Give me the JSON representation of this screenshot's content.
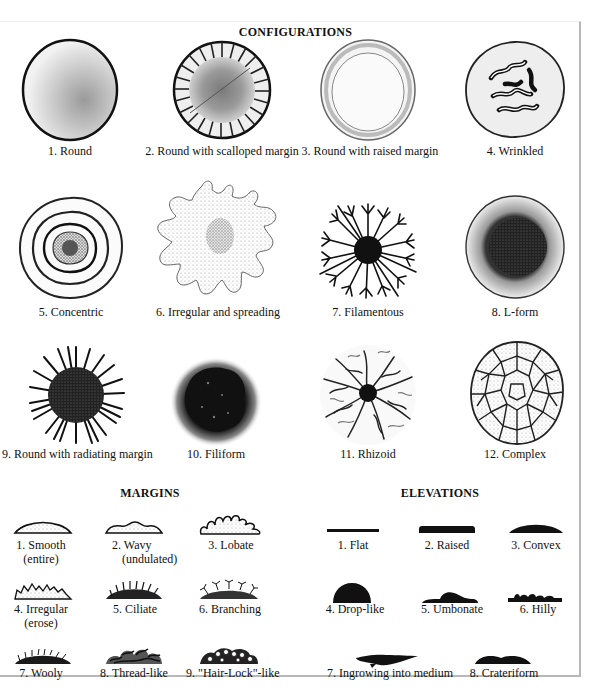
{
  "configurations": {
    "title": "CONFIGURATIONS",
    "items": [
      {
        "label": "1. Round",
        "icon": "round-colony-icon"
      },
      {
        "label": "2. Round with scalloped margin",
        "icon": "scalloped-colony-icon"
      },
      {
        "label": "3. Round with raised margin",
        "icon": "raised-margin-colony-icon"
      },
      {
        "label": "4. Wrinkled",
        "icon": "wrinkled-colony-icon"
      },
      {
        "label": "5. Concentric",
        "icon": "concentric-colony-icon"
      },
      {
        "label": "6. Irregular and spreading",
        "icon": "irregular-colony-icon"
      },
      {
        "label": "7. Filamentous",
        "icon": "filamentous-colony-icon"
      },
      {
        "label": "8. L-form",
        "icon": "l-form-colony-icon"
      },
      {
        "label": "9. Round with radiating margin",
        "icon": "radiating-colony-icon"
      },
      {
        "label": "10. Filiform",
        "icon": "filiform-colony-icon"
      },
      {
        "label": "11. Rhizoid",
        "icon": "rhizoid-colony-icon"
      },
      {
        "label": "12. Complex",
        "icon": "complex-colony-icon"
      }
    ]
  },
  "margins": {
    "title": "MARGINS",
    "items": [
      {
        "label": "1. Smooth",
        "sub": "(entire)",
        "icon": "smooth-margin-icon"
      },
      {
        "label": "2. Wavy",
        "sub": "(undulated)",
        "icon": "wavy-margin-icon"
      },
      {
        "label": "3. Lobate",
        "sub": "",
        "icon": "lobate-margin-icon"
      },
      {
        "label": "4. Irregular",
        "sub": "(erose)",
        "icon": "irregular-margin-icon"
      },
      {
        "label": "5. Ciliate",
        "sub": "",
        "icon": "ciliate-margin-icon"
      },
      {
        "label": "6. Branching",
        "sub": "",
        "icon": "branching-margin-icon"
      },
      {
        "label": "7. Wooly",
        "sub": "",
        "icon": "wooly-margin-icon"
      },
      {
        "label": "8. Thread-like",
        "sub": "",
        "icon": "thread-like-margin-icon"
      },
      {
        "label": "9. \"Hair-Lock\"-like",
        "sub": "",
        "icon": "hair-lock-margin-icon"
      }
    ]
  },
  "elevations": {
    "title": "ELEVATIONS",
    "items": [
      {
        "label": "1. Flat",
        "icon": "flat-elevation-icon"
      },
      {
        "label": "2. Raised",
        "icon": "raised-elevation-icon"
      },
      {
        "label": "3. Convex",
        "icon": "convex-elevation-icon"
      },
      {
        "label": "4. Drop-like",
        "icon": "drop-like-elevation-icon"
      },
      {
        "label": "5. Umbonate",
        "icon": "umbonate-elevation-icon"
      },
      {
        "label": "6. Hilly",
        "icon": "hilly-elevation-icon"
      },
      {
        "label": "7. Ingrowing into medium",
        "icon": "ingrowing-elevation-icon"
      },
      {
        "label": "8. Crateriform",
        "icon": "crateriform-elevation-icon"
      }
    ]
  }
}
